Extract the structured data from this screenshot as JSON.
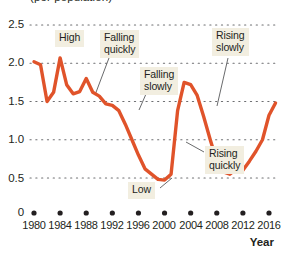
{
  "chart_data": {
    "type": "line",
    "title": "(per population)",
    "xlabel": "Year",
    "ylabel": "",
    "xlim": [
      1979,
      2017
    ],
    "ylim": [
      0,
      2.6
    ],
    "grid": true,
    "grid_style": "dotted-horizontal",
    "legend": "none",
    "line_color": "#e0532a",
    "x_tick_labels": [
      "1980",
      "1984",
      "1988",
      "1992",
      "1996",
      "2000",
      "2004",
      "2008",
      "2012",
      "2016"
    ],
    "x_tick_values": [
      1980,
      1984,
      1988,
      1992,
      1996,
      2000,
      2004,
      2008,
      2012,
      2016
    ],
    "y_tick_labels": [
      "0",
      "0.5",
      "1.0",
      "1.5",
      "2.0",
      "2.5"
    ],
    "y_tick_values": [
      0,
      0.5,
      1.0,
      1.5,
      2.0,
      2.5
    ],
    "axis_break": true,
    "series": [
      {
        "name": "rate",
        "x": [
          1980,
          1981,
          1982,
          1983,
          1984,
          1985,
          1986,
          1987,
          1988,
          1989,
          1990,
          1991,
          1992,
          1993,
          1994,
          1995,
          1996,
          1997,
          1998,
          1999,
          2000,
          2001,
          2002,
          2003,
          2004,
          2005,
          2006,
          2007,
          2008,
          2009,
          2010,
          2011,
          2012,
          2013,
          2014,
          2015,
          2016,
          2017
        ],
        "values": [
          2.02,
          1.98,
          1.5,
          1.62,
          2.07,
          1.72,
          1.6,
          1.63,
          1.8,
          1.62,
          1.57,
          1.47,
          1.45,
          1.38,
          1.2,
          1.0,
          0.8,
          0.62,
          0.55,
          0.48,
          0.47,
          0.55,
          1.38,
          1.75,
          1.72,
          1.58,
          1.3,
          1.0,
          0.72,
          0.58,
          0.55,
          0.62,
          0.6,
          0.72,
          0.85,
          1.0,
          1.32,
          1.48
        ]
      }
    ],
    "annotations": [
      {
        "id": "high",
        "text": "High",
        "x_px": 55,
        "y_px": 30,
        "w_px": 34,
        "leader": false
      },
      {
        "id": "falling-quickly",
        "text": "Falling\nquickly",
        "x_px": 100,
        "y_px": 30,
        "w_px": 48,
        "leader": true
      },
      {
        "id": "falling-slowly",
        "text": "Falling\nslowly",
        "x_px": 140,
        "y_px": 67,
        "w_px": 44,
        "leader": true
      },
      {
        "id": "rising-slowly",
        "text": "Rising\nslowly",
        "x_px": 212,
        "y_px": 28,
        "w_px": 42,
        "leader": true
      },
      {
        "id": "rising-quickly",
        "text": "Rising\nquickly",
        "x_px": 205,
        "y_px": 146,
        "w_px": 46,
        "leader": true
      },
      {
        "id": "low",
        "text": "Low",
        "x_px": 128,
        "y_px": 182,
        "w_px": 31,
        "leader": true
      }
    ]
  },
  "axis": {
    "x_title": "Year"
  }
}
